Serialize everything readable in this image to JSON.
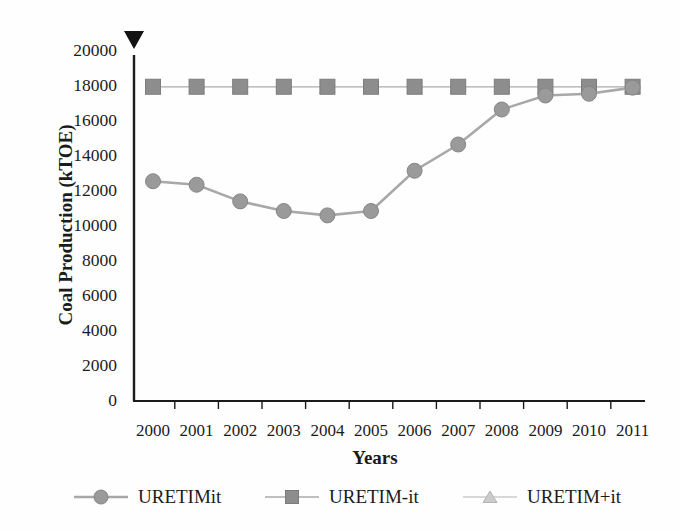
{
  "figure": {
    "background": "#fefefe",
    "axis_top_marker_icon": "down-triangle-icon"
  },
  "chart_data": {
    "type": "line",
    "title": "",
    "xlabel": "Years",
    "ylabel": "Coal Production (kTOE)",
    "categories": [
      "2000",
      "2001",
      "2002",
      "2003",
      "2004",
      "2005",
      "2006",
      "2007",
      "2008",
      "2009",
      "2010",
      "2011"
    ],
    "ylim": [
      0,
      20000
    ],
    "ytick_step": 2000,
    "yticks": [
      0,
      2000,
      4000,
      6000,
      8000,
      10000,
      12000,
      14000,
      16000,
      18000,
      20000
    ],
    "grid": false,
    "legend_position": "bottom",
    "axis_color": "#1b1b1b",
    "text_color": "#1b1b1b",
    "series": [
      {
        "name": "URETIMit",
        "marker": "circle",
        "marker_color": "#9a9a9a",
        "marker_edge": "#868686",
        "line_color": "#a8a8a8",
        "line_width": 2.6,
        "values": [
          12500,
          12300,
          11350,
          10800,
          10550,
          10800,
          13100,
          14600,
          16600,
          17400,
          17500,
          17850
        ]
      },
      {
        "name": "URETIM-it",
        "marker": "square",
        "marker_color": "#8d8d8d",
        "marker_edge": "#7c7c7c",
        "line_color": "#c0c0c0",
        "line_width": 1.6,
        "values": [
          17900,
          17900,
          17900,
          17900,
          17900,
          17900,
          17900,
          17900,
          17900,
          17900,
          17900,
          17900
        ]
      },
      {
        "name": "URETIM+it",
        "marker": "triangle",
        "marker_color": "#cbcbcb",
        "marker_edge": "#b4b4b4",
        "line_color": "#d8d8d8",
        "line_width": 1.5,
        "values": [
          17900,
          17900,
          17900,
          17900,
          17900,
          17900,
          17900,
          17900,
          17900,
          17900,
          17900,
          17900
        ]
      }
    ]
  }
}
